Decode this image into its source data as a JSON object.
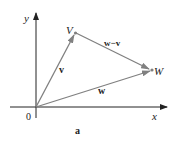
{
  "diagram": {
    "axes": {
      "x_label": "x",
      "y_label": "y",
      "origin_label": "0"
    },
    "points": {
      "V": {
        "label": "V"
      },
      "W": {
        "label": "W"
      }
    },
    "vectors": [
      {
        "name": "v",
        "label": "v",
        "from": "0",
        "to": "V"
      },
      {
        "name": "w",
        "label": "w",
        "from": "0",
        "to": "W"
      },
      {
        "name": "w-v",
        "label": "w−v",
        "from": "V",
        "to": "W"
      }
    ],
    "caption": "a",
    "colors": {
      "axis": "#222222",
      "vector": "#808080",
      "text": "#222222"
    }
  }
}
